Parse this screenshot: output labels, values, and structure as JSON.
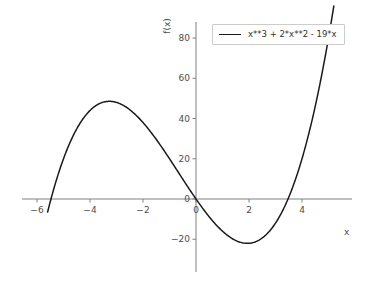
{
  "chart_data": {
    "type": "line",
    "title": "",
    "xlabel": "x",
    "ylabel": "f(x)",
    "expression": "x**3 + 2*x**2 - 19*x",
    "legend": [
      {
        "name": "x**3 + 2*x**2 - 19*x",
        "color": "#1a1a1a"
      }
    ],
    "legend_position": "upper right",
    "grid": false,
    "xlim": [
      -6.6,
      5.8
    ],
    "ylim": [
      -33,
      88
    ],
    "xticks": [
      -6,
      -4,
      -2,
      0,
      2,
      4
    ],
    "xtick_labels": [
      "−6",
      "−4",
      "−2",
      "0",
      "2",
      "4"
    ],
    "yticks": [
      -20,
      0,
      20,
      40,
      60,
      80
    ],
    "ytick_labels": [
      "−20",
      "0",
      "20",
      "40",
      "60",
      "80"
    ],
    "series": [
      {
        "name": "x**3 + 2*x**2 - 19*x",
        "color": "#1a1a1a",
        "x": [
          -5.6,
          -5.4,
          -5.2,
          -5.0,
          -4.8,
          -4.6,
          -4.4,
          -4.2,
          -4.0,
          -3.8,
          -3.6,
          -3.4,
          -3.2,
          -3.0,
          -2.8,
          -2.6,
          -2.4,
          -2.2,
          -2.0,
          -1.8,
          -1.6,
          -1.4,
          -1.2,
          -1.0,
          -0.8,
          -0.6,
          -0.4,
          -0.2,
          0.0,
          0.2,
          0.4,
          0.6,
          0.8,
          1.0,
          1.2,
          1.4,
          1.6,
          1.8,
          2.0,
          2.2,
          2.4,
          2.6,
          2.8,
          3.0,
          3.2,
          3.4,
          3.6,
          3.8,
          4.0,
          4.2,
          4.4,
          4.6,
          4.8,
          5.0,
          5.2
        ],
        "y": [
          -6.46,
          -2.82,
          0.91,
          4.0,
          7.07,
          9.42,
          11.42,
          13.08,
          14.4,
          15.41,
          16.1,
          16.49,
          16.59,
          16.41,
          15.95,
          15.23,
          14.25,
          13.03,
          11.57,
          9.89,
          10.0,
          11.0,
          12.0,
          13.0,
          14.0,
          15.0,
          15.0,
          15.0,
          0.0,
          -3.71,
          -7.22,
          -10.46,
          -13.41,
          -16.0,
          -18.19,
          -19.94,
          -21.2,
          -21.92,
          -22.0,
          -21.47,
          -20.26,
          -18.31,
          -15.58,
          -12.0,
          -7.53,
          -2.11,
          4.3,
          11.75,
          20.0,
          29.56,
          40.06,
          51.66,
          64.35,
          78.0,
          93.09
        ]
      }
    ]
  },
  "axes": {
    "x_axis_label": "x",
    "y_axis_label": "f(x)",
    "axis_color": "#808080",
    "tick_label_color": "#4d4d4d"
  }
}
